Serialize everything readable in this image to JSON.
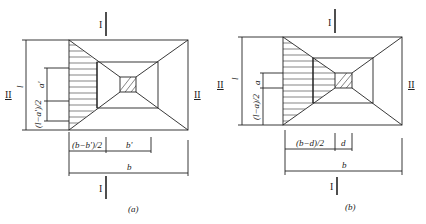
{
  "figures": [
    {
      "id": "a",
      "caption": "(a)",
      "section_top_label": "I",
      "section_bottom_label": "I",
      "section_left_label": "II",
      "section_right_label": "II",
      "dim_l": "l",
      "dim_a": "a'",
      "dim_la2": "(l−a')/2",
      "dim_bb2": "(b−b')/2",
      "dim_bp": "b'",
      "dim_b": "b"
    },
    {
      "id": "b",
      "caption": "(b)",
      "section_top_label": "I",
      "section_bottom_label": "I",
      "section_left_label": "II",
      "section_right_label": "II",
      "dim_l": "l",
      "dim_a": "a",
      "dim_la2": "(l−a)/2",
      "dim_bb2": "(b−d)/2",
      "dim_bp": "d",
      "dim_b": "b"
    }
  ]
}
